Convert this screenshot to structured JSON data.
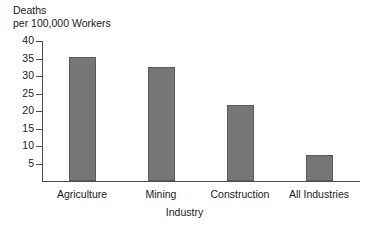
{
  "chart_data": {
    "type": "bar",
    "title": "",
    "categories": [
      "Agriculture",
      "Mining",
      "Construction",
      "All Industries"
    ],
    "values": [
      35.3,
      32.5,
      21.6,
      7.5
    ],
    "xlabel": "Industry",
    "ylabel": "Deaths per 100,000 Workers",
    "ylabel_lines": [
      "Deaths",
      "per 100,000 Workers"
    ],
    "ylim": [
      0,
      40
    ],
    "ytick_values": [
      40,
      35,
      30,
      25,
      20,
      15,
      10,
      5
    ],
    "ytick_labels": [
      "40",
      "35",
      "30",
      "25",
      "20",
      "15",
      "10",
      "5"
    ],
    "grid": false,
    "legend": null,
    "bar_color": "#767676",
    "bar_edge_color": "#5a5a5a",
    "axis_color": "#4d4d4d",
    "background_color": "#ffffff",
    "annotations": []
  }
}
